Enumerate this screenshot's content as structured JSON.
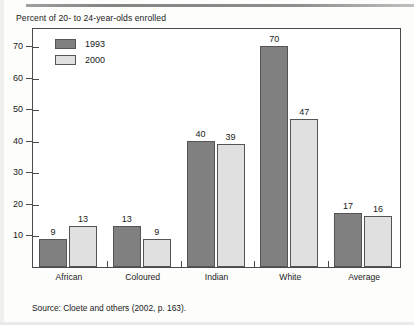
{
  "chart_data": {
    "type": "bar",
    "title": "Percent of 20- to 24-year-olds enrolled",
    "xlabel": "",
    "ylabel": "",
    "ylim": [
      0,
      76
    ],
    "yticks": [
      10,
      20,
      30,
      40,
      50,
      60,
      70
    ],
    "grid": false,
    "legend_position": "top-left",
    "categories": [
      "African",
      "Coloured",
      "Indian",
      "White",
      "Average"
    ],
    "series": [
      {
        "name": "1993",
        "color": "#808080",
        "values": [
          9,
          13,
          40,
          70,
          17
        ]
      },
      {
        "name": "2000",
        "color": "#e0e0e0",
        "values": [
          13,
          9,
          39,
          47,
          16
        ]
      }
    ],
    "data_labels": [
      [
        "9",
        "13"
      ],
      [
        "13",
        "9"
      ],
      [
        "40",
        "39"
      ],
      [
        "70",
        "47"
      ],
      [
        "17",
        "16"
      ]
    ],
    "source": "Source: Cloete and others (2002, p. 163)."
  },
  "legend": {
    "items": [
      {
        "label": "1993",
        "color": "#808080"
      },
      {
        "label": "2000",
        "color": "#e0e0e0"
      }
    ]
  },
  "axis": {
    "y_tick_labels": [
      "70",
      "60",
      "50",
      "40",
      "30",
      "20",
      "10"
    ]
  }
}
